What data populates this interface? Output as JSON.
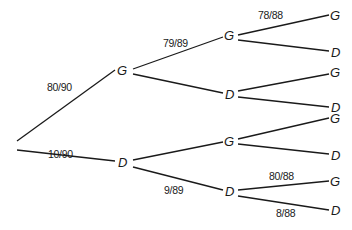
{
  "diagram": {
    "type": "probability-tree",
    "nodes": {
      "level1": [
        {
          "id": "g1",
          "label": "G"
        },
        {
          "id": "d1",
          "label": "D"
        }
      ],
      "level2": [
        {
          "id": "g1g",
          "label": "G",
          "parent": "g1"
        },
        {
          "id": "g1d",
          "label": "D",
          "parent": "g1"
        },
        {
          "id": "d1g",
          "label": "G",
          "parent": "d1"
        },
        {
          "id": "d1d",
          "label": "D",
          "parent": "d1"
        }
      ],
      "level3": [
        {
          "id": "g1g_g",
          "label": "G",
          "parent": "g1g"
        },
        {
          "id": "g1g_d",
          "label": "D",
          "parent": "g1g"
        },
        {
          "id": "g1d_g",
          "label": "G",
          "parent": "g1d"
        },
        {
          "id": "g1d_d",
          "label": "D",
          "parent": "g1d"
        },
        {
          "id": "d1g_g",
          "label": "G",
          "parent": "d1g"
        },
        {
          "id": "d1g_d",
          "label": "D",
          "parent": "d1g"
        },
        {
          "id": "d1d_g",
          "label": "G",
          "parent": "d1d"
        },
        {
          "id": "d1d_d",
          "label": "D",
          "parent": "d1d"
        }
      ]
    },
    "edge_labels": {
      "root_g1": "80/90",
      "root_d1": "10/90",
      "g1_g1g": "79/89",
      "d1_d1d": "9/89",
      "g1g_g": "78/88",
      "d1d_g": "80/88",
      "d1d_d": "8/88"
    }
  }
}
